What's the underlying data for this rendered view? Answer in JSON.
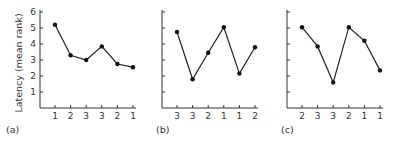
{
  "chart_data": {
    "type": "line",
    "ylabel": "Latency (mean rank)",
    "ylim": [
      0,
      6
    ],
    "yticks": [
      1,
      2,
      3,
      4,
      5,
      6
    ],
    "grid": false,
    "legend": "none",
    "panels": [
      {
        "label": "(a)",
        "categories": [
          "1",
          "2",
          "3",
          "3",
          "2",
          "1"
        ],
        "values": [
          5.2,
          3.3,
          3.0,
          3.85,
          2.75,
          2.55
        ],
        "show_y_labels": true
      },
      {
        "label": "(b)",
        "categories": [
          "3",
          "3",
          "2",
          "1",
          "1",
          "2"
        ],
        "values": [
          4.75,
          1.8,
          3.45,
          5.05,
          2.15,
          3.8
        ],
        "show_y_labels": false
      },
      {
        "label": "(c)",
        "categories": [
          "2",
          "3",
          "3",
          "2",
          "1",
          "1"
        ],
        "values": [
          5.05,
          3.85,
          1.6,
          5.05,
          4.2,
          2.35
        ],
        "show_y_labels": false
      }
    ]
  }
}
